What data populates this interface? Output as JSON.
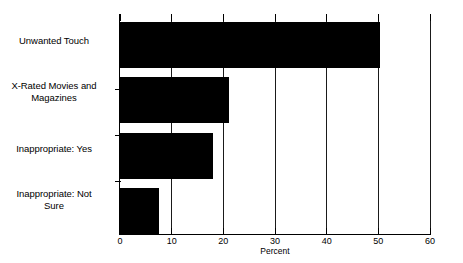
{
  "chart_data": {
    "type": "bar",
    "orientation": "horizontal",
    "title": "",
    "xlabel": "Percent",
    "ylabel": "",
    "xlim": [
      0,
      60
    ],
    "xticks": [
      0,
      10,
      20,
      30,
      40,
      50,
      60
    ],
    "grid": true,
    "legend": false,
    "bar_color": "#000000",
    "categories": [
      "Unwanted Touch",
      "X-Rated Movies and Magazines",
      "Inappropriate: Yes",
      "Inappropriate: Not Sure"
    ],
    "category_lines": [
      [
        "Unwanted Touch"
      ],
      [
        "X-Rated Movies and",
        "Magazines"
      ],
      [
        "Inappropriate: Yes"
      ],
      [
        "Inappropriate: Not",
        "Sure"
      ]
    ],
    "values": [
      50.3,
      21.0,
      18.0,
      7.5
    ]
  }
}
